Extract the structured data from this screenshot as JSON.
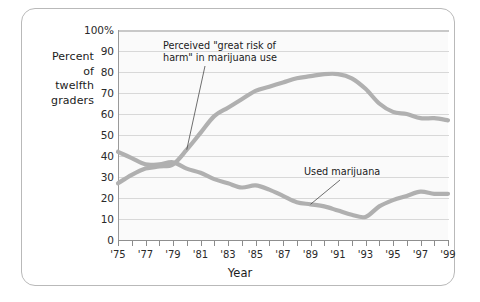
{
  "frame": {
    "title": ""
  },
  "axis_block_label": "Percent\nof\ntwelfth\ngraders",
  "axis_block_lines": [
    "Percent",
    "of",
    "twelfth",
    "graders"
  ],
  "chart_data": {
    "type": "line",
    "title": "",
    "xlabel": "Year",
    "ylabel": "Percent of twelfth graders",
    "ylim": [
      0,
      100
    ],
    "xlim": [
      1975,
      1999
    ],
    "grid": true,
    "legend": "annotations-inline",
    "ytick_labels": [
      "100%",
      "90",
      "80",
      "70",
      "60",
      "50",
      "40",
      "30",
      "20",
      "10",
      "0"
    ],
    "ytick_values": [
      100,
      90,
      80,
      70,
      60,
      50,
      40,
      30,
      20,
      10,
      0
    ],
    "xtick_values": [
      1975,
      1976,
      1977,
      1978,
      1979,
      1980,
      1981,
      1982,
      1983,
      1984,
      1985,
      1986,
      1987,
      1988,
      1989,
      1990,
      1991,
      1992,
      1993,
      1994,
      1995,
      1996,
      1997,
      1998,
      1999
    ],
    "xtick_labels": [
      "'75",
      "",
      "'77",
      "",
      "'79",
      "",
      "'81",
      "",
      "'83",
      "",
      "'85",
      "",
      "'87",
      "",
      "'89",
      "",
      "'91",
      "",
      "'93",
      "",
      "'95",
      "",
      "'97",
      "",
      "'99"
    ],
    "x": [
      1975,
      1976,
      1977,
      1978,
      1979,
      1980,
      1981,
      1982,
      1983,
      1984,
      1985,
      1986,
      1987,
      1988,
      1989,
      1990,
      1991,
      1992,
      1993,
      1994,
      1995,
      1996,
      1997,
      1998,
      1999
    ],
    "series": [
      {
        "name": "Perceived \"great risk of harm\" in marijuana use",
        "color": "#b0b0b0",
        "values": [
          27,
          31,
          34,
          35,
          36,
          43,
          51,
          59,
          63,
          67,
          71,
          73,
          75,
          77,
          78,
          79,
          79,
          77,
          72,
          65,
          61,
          60,
          58,
          58,
          57
        ]
      },
      {
        "name": "Used marijuana",
        "color": "#b0b0b0",
        "values": [
          42,
          39,
          36,
          36,
          37,
          34,
          32,
          29,
          27,
          25,
          26,
          24,
          21,
          18,
          17,
          16,
          14,
          12,
          11,
          16,
          19,
          21,
          23,
          22,
          22
        ]
      }
    ],
    "annotations": [
      {
        "text": "Perceived \"great risk of\nharm\" in marijuana use",
        "target_x": 1980,
        "target_y": 43
      },
      {
        "text": "Used marijuana",
        "target_x": 1989,
        "target_y": 17
      }
    ]
  },
  "colors": {
    "line": "#b0b0b0",
    "grid": "#d8d8d8",
    "axis": "#8f8f8f",
    "frame": "#b9b9b9",
    "plot_bg": "#fafafa",
    "text": "#1b1b1b"
  }
}
